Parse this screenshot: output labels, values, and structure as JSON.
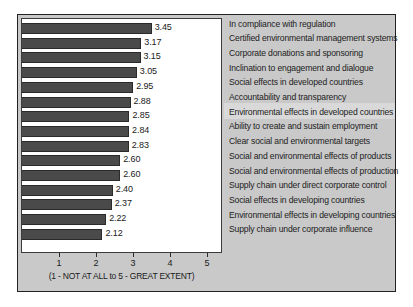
{
  "chart_data": {
    "type": "bar",
    "orientation": "horizontal",
    "title": "",
    "xlabel": "(1 - NOT AT ALL to 5 - GREAT EXTENT)",
    "ylabel": "",
    "xlim": [
      0,
      5
    ],
    "xticks": [
      1,
      2,
      3,
      4,
      5
    ],
    "xticklabels": [
      "1",
      "2",
      "3",
      "4",
      "5"
    ],
    "grid": false,
    "legend_position": "right",
    "bar_color": "#4a4a4a",
    "categories": [
      "In compliance with regulation",
      "Certified environmental management systems",
      "Corporate donations and sponsoring",
      "Inclination to engagement and dialogue",
      "Social effects in developed countries",
      "Accountability and transparency",
      "Environmental effects in developed countries",
      "Ability to create and sustain employment",
      "Clear social and environmental targets",
      "Social and environmental effects of products",
      "Social and environmental effects of production",
      "Supply chain under direct corporate control",
      "Social effects in developing countries",
      "Environmental effects in developing countries",
      "Supply chain under corporate influence"
    ],
    "values": [
      3.45,
      3.17,
      3.15,
      3.05,
      2.95,
      2.88,
      2.85,
      2.84,
      2.83,
      2.6,
      2.6,
      2.4,
      2.37,
      2.22,
      2.12
    ],
    "value_labels": [
      "3.45",
      "3.17",
      "3.15",
      "3.05",
      "2.95",
      "2.88",
      "2.85",
      "2.84",
      "2.83",
      "2.60",
      "2.60",
      "2.40",
      "2.37",
      "2.22",
      "2.12"
    ]
  }
}
